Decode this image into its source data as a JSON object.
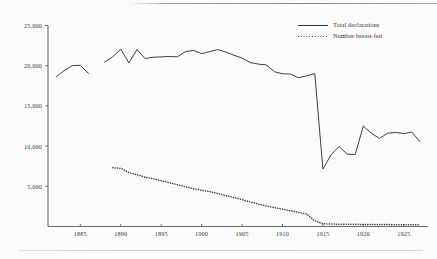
{
  "figure": {
    "background_color": "#fcfcfc",
    "ink_color": "#333333",
    "has_top_rule": true,
    "has_bottom_rule": true
  },
  "legend": {
    "position": "top-right",
    "entries": [
      {
        "label": "Total declarations",
        "style": "solid"
      },
      {
        "label": "Number breast-fed",
        "style": "dotted"
      }
    ]
  },
  "axes": {
    "y_tick_labels": [
      "25,000",
      "20,000",
      "15,000",
      "10,000",
      "5,000"
    ],
    "x_tick_labels": [
      "1885",
      "1890",
      "1895",
      "1900",
      "1905",
      "1910",
      "1915",
      "1920",
      "1925"
    ]
  },
  "chart_data": {
    "type": "line",
    "title": "",
    "subtitle": "",
    "xlabel": "",
    "ylabel": "",
    "xlim": [
      1881,
      1928
    ],
    "ylim": [
      0,
      25000
    ],
    "y_ticks": [
      5000,
      10000,
      15000,
      20000,
      25000
    ],
    "x_ticks": [
      1885,
      1890,
      1895,
      1900,
      1905,
      1910,
      1915,
      1920,
      1925
    ],
    "grid": false,
    "legend_position": "top-right",
    "series": [
      {
        "name": "Total declarations",
        "style": "solid",
        "segments": [
          {
            "x": [
              1882,
              1883,
              1884,
              1885,
              1886
            ],
            "y": [
              18600,
              19400,
              20000,
              20050,
              19050
            ]
          },
          {
            "x": [
              1888,
              1889,
              1890,
              1891,
              1892,
              1893,
              1894,
              1895,
              1896,
              1897,
              1898,
              1899,
              1900,
              1901,
              1902,
              1903,
              1904,
              1905,
              1906,
              1907,
              1908,
              1909,
              1910,
              1911,
              1912,
              1913,
              1914,
              1915,
              1916,
              1917,
              1918,
              1919,
              1920,
              1921,
              1922,
              1923,
              1924,
              1925,
              1926,
              1927
            ],
            "y": [
              20450,
              21100,
              22050,
              20350,
              22000,
              20900,
              21050,
              21100,
              21150,
              21100,
              21750,
              21900,
              21500,
              21750,
              22000,
              21700,
              21300,
              20950,
              20400,
              20200,
              20100,
              19250,
              19000,
              18950,
              18500,
              18750,
              19000,
              7150,
              8900,
              9950,
              9000,
              8950,
              12500,
              11600,
              10950,
              11600,
              11700,
              11550,
              11750,
              10550
            ]
          }
        ]
      },
      {
        "name": "Number breast-fed",
        "style": "dotted",
        "segments": [
          {
            "x": [
              1889,
              1890,
              1891,
              1892,
              1893,
              1894,
              1895,
              1896,
              1897,
              1898,
              1899,
              1900,
              1901,
              1902,
              1903,
              1904,
              1905,
              1906,
              1907,
              1908,
              1909,
              1910,
              1911,
              1912,
              1913,
              1914,
              1915,
              1916,
              1917,
              1918,
              1919,
              1920,
              1921,
              1922,
              1923,
              1924,
              1925,
              1926,
              1927
            ],
            "y": [
              7300,
              7250,
              6700,
              6450,
              6150,
              5950,
              5700,
              5450,
              5200,
              4950,
              4700,
              4500,
              4350,
              4100,
              3850,
              3600,
              3350,
              3050,
              2800,
              2550,
              2350,
              2150,
              1950,
              1750,
              1550,
              700,
              350,
              300,
              290,
              280,
              270,
              260,
              250,
              240,
              235,
              230,
              225,
              220,
              215
            ]
          }
        ]
      }
    ]
  }
}
